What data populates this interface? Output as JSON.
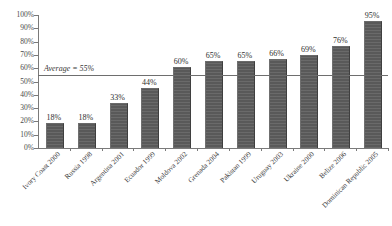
{
  "chart_data": {
    "type": "bar",
    "title": "",
    "xlabel": "",
    "ylabel": "",
    "ylim": [
      0,
      100
    ],
    "ytick_labels": [
      "100%",
      "90%",
      "80%",
      "70%",
      "60%",
      "50%",
      "40%",
      "30%",
      "20%",
      "10%",
      "0%"
    ],
    "ytick_values": [
      100,
      90,
      80,
      70,
      60,
      50,
      40,
      30,
      20,
      10,
      0
    ],
    "grid": false,
    "legend": "none",
    "categories": [
      "Ivory Coast 2000",
      "Russia 1998",
      "Argentina 2001",
      "Ecuador 1999",
      "Moldova 2002",
      "Grenada 2004",
      "Pakistan 1999",
      "Uruguay 2003",
      "Ukraine 2000",
      "Belize 2006",
      "Dominican Republic 2005"
    ],
    "values": [
      18,
      18,
      33,
      44,
      60,
      65,
      65,
      66,
      69,
      76,
      95
    ],
    "data_labels": [
      "18%",
      "18%",
      "33%",
      "44%",
      "60%",
      "65%",
      "65%",
      "66%",
      "69%",
      "76%",
      "95%"
    ],
    "annotations": [
      {
        "name": "average-line",
        "label": "Average = 55%",
        "value": 55
      }
    ],
    "bar_color": "#595959",
    "average_line_color": "#6e6e6e",
    "axis_color": "#7a7a7a"
  }
}
